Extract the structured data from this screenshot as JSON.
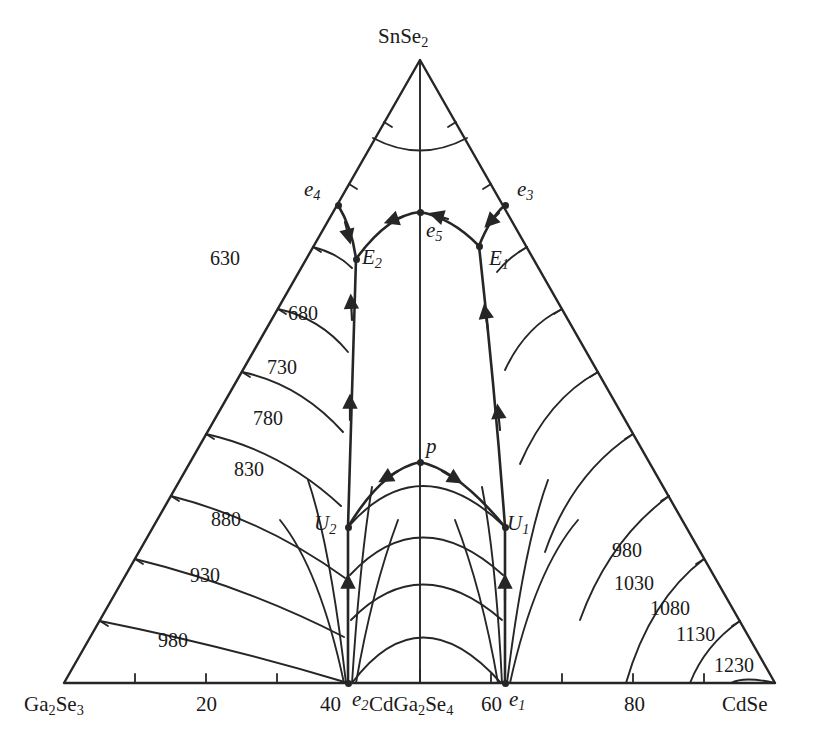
{
  "figure": {
    "kind": "ternary-liquidus-projection",
    "line_color": "#262626",
    "background": "#ffffff",
    "temperature_unit_implied": "°C"
  },
  "vertices": {
    "top": "SnSe2",
    "bottom_left": "Ga2Se3",
    "bottom_right": "CdSe"
  },
  "axis_bottom": {
    "ticks": [
      "20",
      "40",
      "60",
      "80"
    ],
    "compound_label": "CdGa2Se4"
  },
  "invariant_points": [
    {
      "name": "e4",
      "x": 338,
      "y": 205,
      "label_dx": -34,
      "label_dy": -26
    },
    {
      "name": "e5",
      "x": 420,
      "y": 212,
      "label_dx": 6,
      "label_dy": 8
    },
    {
      "name": "e3",
      "x": 505,
      "y": 205,
      "label_dx": 12,
      "label_dy": -26
    },
    {
      "name": "E2",
      "x": 356,
      "y": 259,
      "label_dx": 6,
      "label_dy": -12
    },
    {
      "name": "E1",
      "x": 479,
      "y": 246,
      "label_dx": 10,
      "label_dy": 2
    },
    {
      "name": "U2",
      "x": 348,
      "y": 527,
      "label_dx": -34,
      "label_dy": -14
    },
    {
      "name": "U1",
      "x": 505,
      "y": 527,
      "label_dx": 2,
      "label_dy": -14
    },
    {
      "name": "p",
      "x": 420,
      "y": 462,
      "label_dx": 6,
      "label_dy": -26
    },
    {
      "name": "e2",
      "x": 348,
      "y": 683,
      "label_dx": 4,
      "label_dy": 6
    },
    {
      "name": "e1",
      "x": 505,
      "y": 683,
      "label_dx": 4,
      "label_dy": 6
    }
  ],
  "chart_data": {
    "type": "line",
    "title": "",
    "xlabel": "",
    "ylabel": "",
    "subtype": "ternary liquidus projection with isotherms",
    "components": [
      "SnSe2",
      "Ga2Se3",
      "CdSe"
    ],
    "bottom_axis_ticks": [
      20,
      40,
      60,
      80
    ],
    "isotherms_left_branch": [
      630,
      680,
      730,
      780,
      830,
      880,
      930,
      980
    ],
    "isotherms_right_branch": [
      980,
      1030,
      1080,
      1130,
      1230
    ],
    "isotherm_label_positions_left": [
      {
        "value": "630",
        "x": 210,
        "y": 248
      },
      {
        "value": "680",
        "x": 288,
        "y": 303
      },
      {
        "value": "730",
        "x": 267,
        "y": 357
      },
      {
        "value": "780",
        "x": 253,
        "y": 408
      },
      {
        "value": "830",
        "x": 234,
        "y": 459
      },
      {
        "value": "880",
        "x": 211,
        "y": 509
      },
      {
        "value": "930",
        "x": 190,
        "y": 565
      },
      {
        "value": "980",
        "x": 158,
        "y": 630
      }
    ],
    "isotherm_label_positions_right": [
      {
        "value": "980",
        "x": 612,
        "y": 540
      },
      {
        "value": "1030",
        "x": 614,
        "y": 573
      },
      {
        "value": "1080",
        "x": 650,
        "y": 598
      },
      {
        "value": "1130",
        "x": 676,
        "y": 624
      },
      {
        "value": "1230",
        "x": 714,
        "y": 655
      }
    ],
    "invariant_point_names": [
      "e1",
      "e2",
      "e3",
      "e4",
      "e5",
      "E1",
      "E2",
      "U1",
      "U2",
      "p"
    ],
    "boundary_curve_count": 6,
    "grid": false,
    "legend": "none"
  }
}
